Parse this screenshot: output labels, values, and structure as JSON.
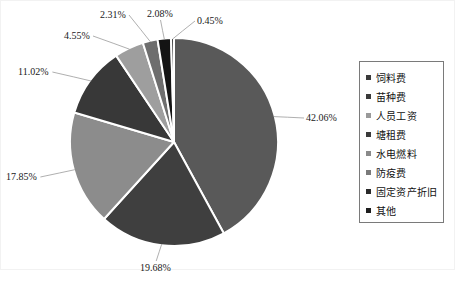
{
  "chart_data": {
    "type": "pie",
    "title": "",
    "subtitle": "",
    "xlabel": "",
    "ylabel": "",
    "grid": false,
    "legend_position": "right",
    "start_angle_deg": 0,
    "direction": "clockwise",
    "categories": [
      "饲料费",
      "苗种费",
      "人员工资",
      "塘租费",
      "水电燃料",
      "防疫费",
      "固定资产折旧",
      "其他"
    ],
    "values": [
      42.06,
      19.68,
      17.85,
      11.02,
      4.55,
      2.31,
      2.08,
      0.45
    ],
    "value_unit": "%",
    "data_labels": [
      "42.06%",
      "19.68%",
      "17.85%",
      "11.02%",
      "4.55%",
      "2.31%",
      "2.08%",
      "0.45%"
    ],
    "colors": [
      "#595959",
      "#3f3f3f",
      "#8c8c8c",
      "#383838",
      "#9e9e9e",
      "#6e6e6e",
      "#141414",
      "#2b2b2b"
    ],
    "slice_gap_color": "#ffffff"
  },
  "labels": [
    {
      "text": "42.06%",
      "x": 306,
      "y": 113,
      "leader": true
    },
    {
      "text": "19.68%",
      "x": 140,
      "y": 263,
      "leader": true
    },
    {
      "text": "17.85%",
      "x": 6,
      "y": 172,
      "leader": true
    },
    {
      "text": "11.02%",
      "x": 18,
      "y": 67,
      "leader": true
    },
    {
      "text": "4.55%",
      "x": 64,
      "y": 31,
      "leader": true
    },
    {
      "text": "2.31%",
      "x": 100,
      "y": 10,
      "leader": true
    },
    {
      "text": "2.08%",
      "x": 147,
      "y": 9,
      "leader": true
    },
    {
      "text": "0.45%",
      "x": 197,
      "y": 16,
      "leader": true
    }
  ],
  "legend": {
    "marker_shape": "square",
    "items": [
      {
        "label": "饲料费",
        "color": "#3a3a3a"
      },
      {
        "label": "苗种费",
        "color": "#3a3a3a"
      },
      {
        "label": "人员工资",
        "color": "#9a9a9a"
      },
      {
        "label": "塘租费",
        "color": "#3a3a3a"
      },
      {
        "label": "水电燃料",
        "color": "#8a8a8a"
      },
      {
        "label": "防疫费",
        "color": "#7a7a7a"
      },
      {
        "label": "固定资产折旧",
        "color": "#2a2a2a"
      },
      {
        "label": "其他",
        "color": "#1e1e1e"
      }
    ]
  },
  "footer": {
    "caption": ""
  }
}
